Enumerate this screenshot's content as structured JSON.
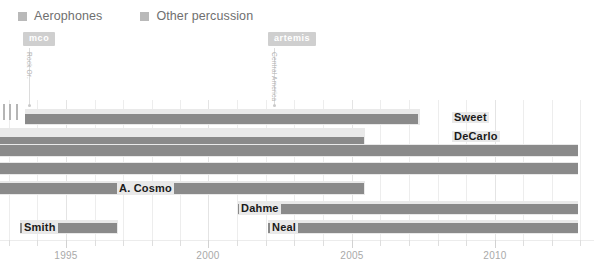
{
  "legend": {
    "items": [
      {
        "label": "Aerophones",
        "color": "#b9b9b9"
      },
      {
        "label": "Other percussion",
        "color": "#b9b9b9"
      }
    ]
  },
  "annotations": [
    {
      "badge": "mco",
      "vertical_text": "Rock Or.",
      "x": 27,
      "badge_color": "#cfcfcf"
    },
    {
      "badge": "artemis",
      "vertical_text": "Central America",
      "x": 272,
      "badge_color": "#cfcfcf"
    }
  ],
  "axis": {
    "labels": [
      "1995",
      "2000",
      "2005",
      "2010"
    ],
    "label_x": [
      66,
      208,
      352,
      495
    ],
    "tick_x": [
      9,
      37,
      66,
      95,
      123,
      152,
      180,
      208,
      237,
      266,
      294,
      323,
      352,
      380,
      409,
      438,
      466,
      495,
      523,
      552,
      580
    ],
    "major_tick_index": [
      2,
      7,
      12,
      17
    ]
  },
  "chart_data": {
    "type": "bar",
    "orientation": "horizontal",
    "title": "",
    "xlabel": "",
    "ylabel": "",
    "xlim": [
      1993.5,
      2013
    ],
    "grid": true,
    "legend_position": "top-left",
    "colors": {
      "band": "#e9e9e9",
      "bar": "#8a8a8a",
      "grid": "#ededed",
      "axis_text": "#a9a9a9"
    },
    "categories": [
      "Sweet",
      "DeCarlo",
      "row-3",
      "row-4",
      "A. Cosmo",
      "Dahme",
      "Neal",
      "Smith"
    ],
    "series": [
      {
        "name": "Aerophones",
        "note": "light band extent"
      },
      {
        "name": "Other percussion",
        "note": "dark bar extent"
      }
    ],
    "rows": [
      {
        "label": "Sweet",
        "label_x": 452,
        "band_start": 25,
        "band_end": 420,
        "bar_start": 25,
        "bar_end": 418,
        "y": 9,
        "band_h": 16,
        "bar_y": 5,
        "bar_h": 10
      },
      {
        "label": "DeCarlo",
        "label_x": 452,
        "band_start": 0,
        "band_end": 365,
        "bar_start": 0,
        "bar_end": 364,
        "y": 28,
        "band_h": 16,
        "bar_y": 9,
        "bar_h": 8
      },
      {
        "label": "",
        "label_x": 0,
        "band_start": 0,
        "band_end": 578,
        "bar_start": 0,
        "bar_end": 578,
        "y": 44,
        "band_h": 13,
        "bar_y": 1,
        "bar_h": 11
      },
      {
        "label": "",
        "label_x": 0,
        "band_start": 0,
        "band_end": 578,
        "bar_start": 0,
        "bar_end": 578,
        "y": 62,
        "band_h": 13,
        "bar_y": 1,
        "bar_h": 11
      },
      {
        "label": "A. Cosmo",
        "label_x": 117,
        "band_start": 0,
        "band_end": 365,
        "bar_start": 0,
        "bar_end": 364,
        "y": 81,
        "band_h": 14,
        "bar_y": 2,
        "bar_h": 11
      },
      {
        "label": "Dahme",
        "label_x": 239,
        "band_start": 238,
        "band_end": 578,
        "bar_start": 238,
        "bar_end": 578,
        "y": 101,
        "band_h": 14,
        "bar_y": 3,
        "bar_h": 10
      },
      {
        "label": "Neal",
        "label_x": 270,
        "band_start": 268,
        "band_end": 578,
        "bar_start": 268,
        "bar_end": 578,
        "y": 120,
        "band_h": 14,
        "bar_y": 3,
        "bar_h": 10
      },
      {
        "label": "Smith",
        "label_x": 22,
        "band_start": 20,
        "band_end": 118,
        "bar_start": 20,
        "bar_end": 117,
        "y": 120,
        "band_h": 14,
        "bar_y": 3,
        "bar_h": 10
      }
    ],
    "left_stubs": [
      {
        "x": 3,
        "y": 4,
        "w": 2,
        "h": 16
      },
      {
        "x": 9,
        "y": 4,
        "w": 2,
        "h": 16
      },
      {
        "x": 16,
        "y": 4,
        "w": 2,
        "h": 16
      }
    ]
  }
}
